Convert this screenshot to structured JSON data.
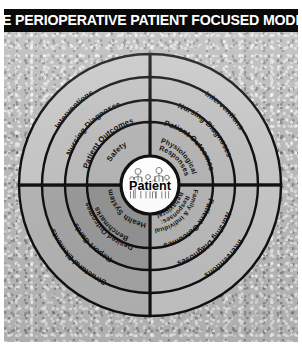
{
  "title": {
    "text": "THE PERIOPERATIVE PATIENT FOCUSED MODEL",
    "superscript": "1"
  },
  "center": {
    "label": "Patient",
    "icon": "people-figures-icon"
  },
  "colors": {
    "title_bar_background": "#0a0a0a",
    "title_text": "#ffffff",
    "panel_background": "#b9b9b9",
    "ring_outline": "#111111",
    "ring_light": "#c9c9c9",
    "ring_mid": "#bdbdbd",
    "ring_dark": "#a3a3a3",
    "ring_darkest": "#8f8f8f",
    "center_fill": "#ffffff"
  },
  "diagram": {
    "type": "concentric-quadrant-model",
    "rings_count": 4,
    "quadrants_count": 4,
    "quadrants": [
      {
        "id": "upper-left",
        "position": "upper-left",
        "rings": [
          {
            "index": 1,
            "label": "Safety"
          },
          {
            "index": 2,
            "label": "Patient Outcomes"
          },
          {
            "index": 3,
            "label": "Nursing Diagnoses"
          },
          {
            "index": 4,
            "label": "Interventions"
          }
        ]
      },
      {
        "id": "upper-right",
        "position": "upper-right",
        "rings": [
          {
            "index": 1,
            "label": "Physiological Responses"
          },
          {
            "index": 2,
            "label": "Patient Outcomes"
          },
          {
            "index": 3,
            "label": "Nursing Diagnoses"
          },
          {
            "index": 4,
            "label": "Interventions"
          }
        ]
      },
      {
        "id": "lower-right",
        "position": "lower-right",
        "rings": [
          {
            "index": 1,
            "label": "Behavioral Responses: Family & Individual"
          },
          {
            "index": 2,
            "label": "Patient Outcomes"
          },
          {
            "index": 3,
            "label": "Nursing Diagnoses"
          },
          {
            "index": 4,
            "label": "Interventions"
          }
        ]
      },
      {
        "id": "lower-left",
        "position": "lower-left",
        "rings": [
          {
            "index": 1,
            "label": "Health System"
          },
          {
            "index": 2,
            "label": "Benchmarks Desired Outcomes"
          },
          {
            "index": 3,
            "label": "Report Cards"
          },
          {
            "index": 4,
            "label": "Structural Elements"
          }
        ]
      }
    ],
    "labels_flat": {
      "ul_r1": "Safety",
      "ul_r2": "Patient Outcomes",
      "ul_r3": "Nursing Diagnoses",
      "ul_r4": "Interventions",
      "ur_r1a": "Physiological",
      "ur_r1b": "Responses",
      "ur_r2": "Patient Outcomes",
      "ur_r3": "Nursing Diagnoses",
      "ur_r4": "Interventions",
      "lr_r1a": "Behavioral",
      "lr_r1b": "Responses:",
      "lr_r1c": "Family & Individual",
      "lr_r2": "Patient Outcomes",
      "lr_r3": "Nursing Diagnoses",
      "lr_r4": "Interventions",
      "ll_r1": "Health System",
      "ll_r2a": "Benchmarks",
      "ll_r2b": "Desired Outcomes",
      "ll_r3": "Report Cards",
      "ll_r4": "Structural Elements"
    }
  }
}
